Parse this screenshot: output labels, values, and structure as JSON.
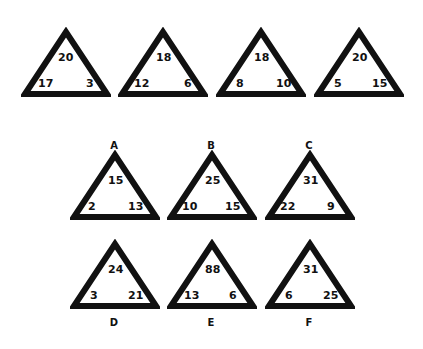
{
  "example_triangles": [
    {
      "top": "20",
      "left": "17",
      "right": "3"
    },
    {
      "top": "18",
      "left": "12",
      "right": "6"
    },
    {
      "top": "18",
      "left": "8",
      "right": "10"
    },
    {
      "top": "20",
      "left": "5",
      "right": "15"
    }
  ],
  "option_triangles": [
    {
      "label": "A",
      "top": "15",
      "left": "2",
      "right": "13"
    },
    {
      "label": "B",
      "top": "25",
      "left": "10",
      "right": "15"
    },
    {
      "label": "C",
      "top": "31",
      "left": "22",
      "right": "9"
    },
    {
      "label": "D",
      "top": "24",
      "left": "3",
      "right": "21"
    },
    {
      "label": "E",
      "top": "88",
      "left": "13",
      "right": "6"
    },
    {
      "label": "F",
      "top": "31",
      "left": "6",
      "right": "25"
    }
  ],
  "colors": {
    "stroke": "#111111",
    "background": "#ffffff"
  }
}
